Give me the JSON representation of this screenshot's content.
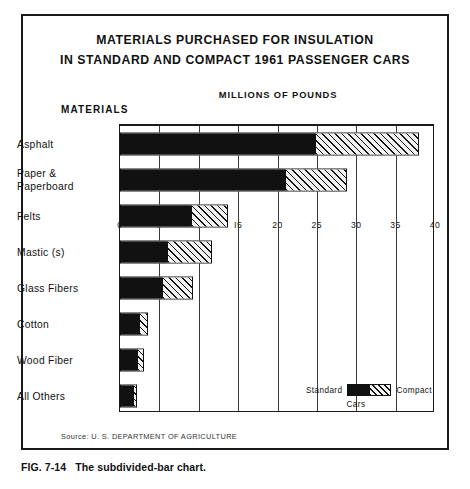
{
  "figure": {
    "caption_number": "FIG. 7-14",
    "caption_text": "The subdivided-bar chart.",
    "source": "Source: U. S. DEPARTMENT OF AGRICULTURE",
    "materials_heading": "MATERIALS"
  },
  "legend": {
    "left_label": "Standard",
    "right_label": "Compact",
    "bottom_label": "Cars"
  },
  "colors": {
    "standard": "#111111",
    "compact": "#f2f2f2",
    "ink": "#1a1a1a",
    "paper": "#ffffff"
  },
  "chart_data": {
    "type": "bar",
    "orientation": "horizontal",
    "stacked": true,
    "title": "MATERIALS PURCHASED FOR INSULATION IN STANDARD AND COMPACT 1961 PASSENGER CARS",
    "title_lines": [
      "MATERIALS PURCHASED FOR INSULATION",
      "IN STANDARD AND COMPACT 1961 PASSENGER CARS"
    ],
    "xlabel": "MILLIONS OF POUNDS",
    "ylabel": "MATERIALS",
    "xlim": [
      0,
      40
    ],
    "xticks": [
      0,
      5,
      10,
      15,
      20,
      25,
      30,
      35,
      40
    ],
    "xtick_labels": [
      "0",
      "5",
      "IO",
      "I5",
      "20",
      "25",
      "30",
      "35",
      "40"
    ],
    "grid": true,
    "legend_position": "inside-lower-right",
    "categories": [
      "Asphalt",
      "Paper &\nPaperboard",
      "Felts",
      "Mastic (s)",
      "Glass Fibers",
      "Cotton",
      "Wood Fiber",
      "All Others"
    ],
    "series": [
      {
        "name": "Standard",
        "values": [
          24.8,
          21.0,
          9.0,
          6.0,
          5.3,
          2.4,
          2.2,
          1.8
        ]
      },
      {
        "name": "Compact",
        "values": [
          13.2,
          7.8,
          4.7,
          5.7,
          4.0,
          1.1,
          0.9,
          0.3
        ]
      }
    ],
    "totals": [
      38.0,
      28.8,
      13.7,
      11.7,
      9.3,
      3.5,
      3.1,
      2.1
    ]
  }
}
